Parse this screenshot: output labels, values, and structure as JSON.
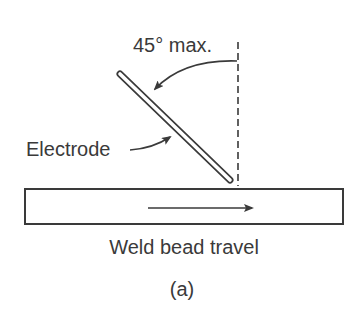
{
  "diagram": {
    "angle_label": "45° max.",
    "electrode_label": "Electrode",
    "travel_label": "Weld bead travel",
    "caption": "(a)",
    "colors": {
      "ink": "#3a3a3a",
      "background": "#ffffff"
    }
  }
}
